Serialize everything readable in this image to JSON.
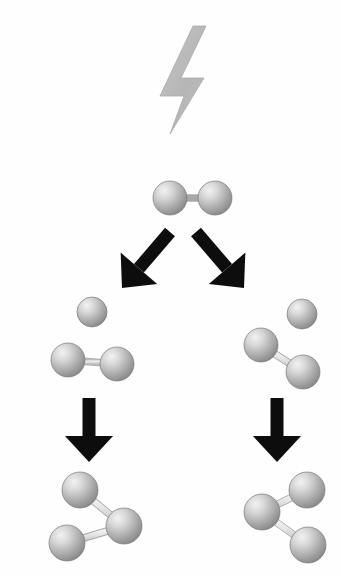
{
  "figure": {
    "title": "Formation of ozone by lightning",
    "background_color": "#fefefe",
    "width": 341,
    "height": 576
  },
  "palette": {
    "atom_light": "#e8e8e8",
    "atom_mid": "#b4b4b4",
    "atom_dark": "#8a8a8a",
    "atom_edge": "#7a7a7a",
    "bond_light": "#f0f0f0",
    "bond_dark": "#c2c2c2",
    "bond_edge": "#a8a8a8",
    "arrow_color": "#0d0d0d",
    "bolt_color": "#b9b9b9",
    "bolt_edge": "#ababab"
  },
  "elements": {
    "lightning_bolt": {
      "name": "lightning-bolt",
      "label": "Lightning bolt (energy source)",
      "points": "193,26 160,96 184,96 170,134 204,78 181,78 206,26",
      "color": "#b9b9b9"
    },
    "arrows": [
      {
        "name": "arrow-split-left",
        "label": "Dissociation arrow pointing down-left",
        "direction": "down-left",
        "x1": 170,
        "y1": 232,
        "x2": 122,
        "y2": 288,
        "width": 13
      },
      {
        "name": "arrow-split-right",
        "label": "Dissociation arrow pointing down-right",
        "direction": "down-right",
        "x1": 196,
        "y1": 232,
        "x2": 244,
        "y2": 288,
        "width": 13
      },
      {
        "name": "arrow-combine-left",
        "label": "Recombination arrow pointing down",
        "direction": "down",
        "x1": 89,
        "y1": 398,
        "x2": 89,
        "y2": 462,
        "width": 13
      },
      {
        "name": "arrow-combine-right",
        "label": "Recombination arrow pointing down",
        "direction": "down",
        "x1": 277,
        "y1": 398,
        "x2": 277,
        "y2": 462,
        "width": 13
      }
    ],
    "molecules": [
      {
        "name": "molecule-oxygen-reactant",
        "label": "Oxygen molecule O2",
        "formula": "O2",
        "atoms": [
          {
            "cx": 170,
            "cy": 198,
            "r": 17
          },
          {
            "cx": 215,
            "cy": 198,
            "r": 17
          }
        ],
        "bonds": [
          {
            "from": 0,
            "to": 1,
            "w": 6
          }
        ]
      },
      {
        "name": "atom-oxygen-free-left",
        "label": "Free oxygen atom O",
        "formula": "O",
        "atoms": [
          {
            "cx": 92,
            "cy": 312,
            "r": 15
          }
        ],
        "bonds": []
      },
      {
        "name": "molecule-oxygen-left",
        "label": "Oxygen molecule O2",
        "formula": "O2",
        "atoms": [
          {
            "cx": 68,
            "cy": 360,
            "r": 17
          },
          {
            "cx": 117,
            "cy": 364,
            "r": 17
          }
        ],
        "bonds": [
          {
            "from": 0,
            "to": 1,
            "w": 6
          }
        ]
      },
      {
        "name": "atom-oxygen-free-right",
        "label": "Free oxygen atom O",
        "formula": "O",
        "atoms": [
          {
            "cx": 302,
            "cy": 314,
            "r": 15
          }
        ],
        "bonds": []
      },
      {
        "name": "molecule-oxygen-right",
        "label": "Oxygen molecule O2",
        "formula": "O2",
        "atoms": [
          {
            "cx": 261,
            "cy": 345,
            "r": 17
          },
          {
            "cx": 303,
            "cy": 372,
            "r": 17
          }
        ],
        "bonds": [
          {
            "from": 0,
            "to": 1,
            "w": 6
          }
        ]
      },
      {
        "name": "molecule-ozone-left",
        "label": "Ozone molecule O3",
        "formula": "O3",
        "atoms": [
          {
            "cx": 80,
            "cy": 490,
            "r": 18
          },
          {
            "cx": 124,
            "cy": 526,
            "r": 18
          },
          {
            "cx": 67,
            "cy": 543,
            "r": 18
          }
        ],
        "bonds": [
          {
            "from": 0,
            "to": 1,
            "w": 6
          },
          {
            "from": 1,
            "to": 2,
            "w": 6
          }
        ]
      },
      {
        "name": "molecule-ozone-right",
        "label": "Ozone molecule O3",
        "formula": "O3",
        "atoms": [
          {
            "cx": 307,
            "cy": 490,
            "r": 18
          },
          {
            "cx": 262,
            "cy": 512,
            "r": 18
          },
          {
            "cx": 308,
            "cy": 545,
            "r": 18
          }
        ],
        "bonds": [
          {
            "from": 0,
            "to": 1,
            "w": 6
          },
          {
            "from": 1,
            "to": 2,
            "w": 6
          }
        ]
      }
    ]
  }
}
